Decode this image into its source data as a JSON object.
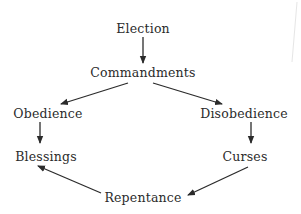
{
  "diagram": {
    "type": "cycle-flow",
    "nodes": [
      {
        "id": "election",
        "label": "Election"
      },
      {
        "id": "commandments",
        "label": "Commandments"
      },
      {
        "id": "obedience",
        "label": "Obedience"
      },
      {
        "id": "disobedience",
        "label": "Disobedience"
      },
      {
        "id": "blessings",
        "label": "Blessings"
      },
      {
        "id": "curses",
        "label": "Curses"
      },
      {
        "id": "repentance",
        "label": "Repentance"
      }
    ],
    "edges": [
      {
        "from": "election",
        "to": "commandments"
      },
      {
        "from": "commandments",
        "to": "obedience"
      },
      {
        "from": "commandments",
        "to": "disobedience"
      },
      {
        "from": "obedience",
        "to": "blessings"
      },
      {
        "from": "disobedience",
        "to": "curses"
      },
      {
        "from": "curses",
        "to": "repentance"
      },
      {
        "from": "repentance",
        "to": "blessings"
      }
    ],
    "colors": {
      "text": "#2b2b2b",
      "arrow": "#2b2b2b",
      "background": "#ffffff"
    }
  }
}
